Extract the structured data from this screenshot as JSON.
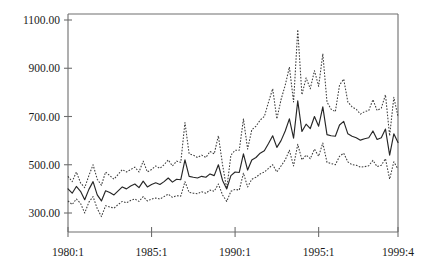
{
  "chart_data": {
    "type": "line",
    "title": "",
    "subtitle": "",
    "xlabel": "",
    "ylabel": "",
    "grid": false,
    "legend": "none",
    "xlim": [
      "1980:1",
      "1999:4"
    ],
    "ylim": [
      220,
      1100
    ],
    "y_ticks": [
      300,
      500,
      700,
      900,
      1100
    ],
    "y_tick_labels": [
      "300.00",
      "500.00",
      "700.00",
      "900.00",
      "1100.00"
    ],
    "x_tick_labels": [
      "1980:1",
      "1985:1",
      "1990:1",
      "1995:1",
      "1999:4"
    ],
    "x_tick_index": [
      0,
      20,
      40,
      60,
      79
    ],
    "x": [
      "1980:1",
      "1980:2",
      "1980:3",
      "1980:4",
      "1981:1",
      "1981:2",
      "1981:3",
      "1981:4",
      "1982:1",
      "1982:2",
      "1982:3",
      "1982:4",
      "1983:1",
      "1983:2",
      "1983:3",
      "1983:4",
      "1984:1",
      "1984:2",
      "1984:3",
      "1984:4",
      "1985:1",
      "1985:2",
      "1985:3",
      "1985:4",
      "1986:1",
      "1986:2",
      "1986:3",
      "1986:4",
      "1987:1",
      "1987:2",
      "1987:3",
      "1987:4",
      "1988:1",
      "1988:2",
      "1988:3",
      "1988:4",
      "1989:1",
      "1989:2",
      "1989:3",
      "1989:4",
      "1990:1",
      "1990:2",
      "1990:3",
      "1990:4",
      "1991:1",
      "1991:2",
      "1991:3",
      "1991:4",
      "1992:1",
      "1992:2",
      "1992:3",
      "1992:4",
      "1993:1",
      "1993:2",
      "1993:3",
      "1993:4",
      "1994:1",
      "1994:2",
      "1994:3",
      "1994:4",
      "1995:1",
      "1995:2",
      "1995:3",
      "1995:4",
      "1996:1",
      "1996:2",
      "1996:3",
      "1996:4",
      "1997:1",
      "1997:2",
      "1997:3",
      "1997:4",
      "1998:1",
      "1998:2",
      "1998:3",
      "1998:4",
      "1999:1",
      "1999:2",
      "1999:3",
      "1999:4"
    ],
    "series": [
      {
        "name": "upper-band",
        "style": "dotted",
        "values": [
          452,
          430,
          470,
          425,
          405,
          455,
          500,
          440,
          415,
          470,
          455,
          440,
          460,
          480,
          470,
          480,
          490,
          470,
          515,
          470,
          480,
          495,
          485,
          500,
          520,
          495,
          515,
          510,
          675,
          545,
          540,
          530,
          540,
          530,
          555,
          545,
          620,
          500,
          400,
          540,
          560,
          560,
          690,
          565,
          645,
          660,
          685,
          700,
          760,
          815,
          690,
          770,
          830,
          905,
          760,
          1060,
          790,
          860,
          815,
          890,
          825,
          960,
          760,
          730,
          720,
          830,
          855,
          760,
          740,
          730,
          710,
          720,
          725,
          770,
          725,
          735,
          790,
          620,
          780,
          700
        ]
      },
      {
        "name": "forecast-mean",
        "style": "solid",
        "values": [
          400,
          382,
          410,
          390,
          355,
          398,
          430,
          375,
          350,
          392,
          385,
          375,
          392,
          408,
          400,
          412,
          420,
          405,
          432,
          408,
          418,
          425,
          418,
          430,
          445,
          428,
          440,
          438,
          520,
          452,
          448,
          445,
          452,
          448,
          462,
          455,
          500,
          435,
          400,
          455,
          470,
          468,
          545,
          478,
          520,
          530,
          548,
          558,
          588,
          620,
          572,
          600,
          640,
          690,
          610,
          765,
          638,
          668,
          650,
          700,
          660,
          740,
          625,
          620,
          618,
          665,
          680,
          628,
          618,
          612,
          602,
          608,
          612,
          640,
          605,
          612,
          648,
          540,
          628,
          592
        ]
      },
      {
        "name": "lower-band",
        "style": "dotted",
        "values": [
          350,
          335,
          358,
          340,
          300,
          345,
          368,
          318,
          285,
          330,
          325,
          320,
          335,
          348,
          342,
          352,
          358,
          348,
          368,
          350,
          358,
          362,
          358,
          368,
          378,
          365,
          372,
          370,
          430,
          385,
          382,
          380,
          388,
          382,
          395,
          390,
          420,
          375,
          348,
          390,
          398,
          395,
          465,
          408,
          440,
          448,
          462,
          470,
          485,
          500,
          470,
          495,
          520,
          560,
          495,
          585,
          520,
          540,
          525,
          565,
          535,
          590,
          510,
          505,
          500,
          535,
          548,
          512,
          500,
          498,
          490,
          492,
          496,
          518,
          492,
          498,
          525,
          440,
          512,
          482
        ]
      }
    ]
  },
  "axis": {
    "y_title": "",
    "x_title": ""
  }
}
